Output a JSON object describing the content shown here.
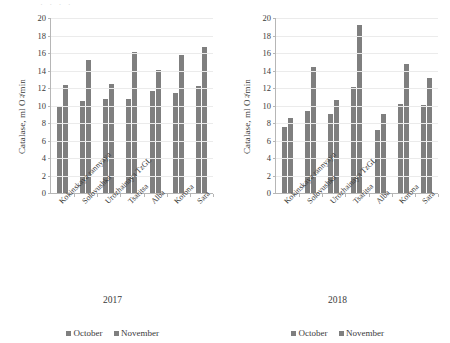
{
  "figure": {
    "top_cropped_text": "· ·  ·  ·",
    "bar_color": "#7f7f7f",
    "grid_color": "#ebebeb",
    "axis_color": "#b6b6b6",
    "text_color": "#3a3a3a"
  },
  "panels": [
    {
      "id": "panel-2017",
      "caption": "2017",
      "ylabel_prefix": "Catalase, ml O",
      "ylabel_sub": "2",
      "ylabel_suffix": "/min",
      "legend": [
        {
          "label": "October"
        },
        {
          "label": "November"
        }
      ]
    },
    {
      "id": "panel-2018",
      "caption": "2018",
      "ylabel_prefix": "Catalase, ml O",
      "ylabel_sub": "2",
      "ylabel_suffix": "/min",
      "legend": [
        {
          "label": "October"
        },
        {
          "label": "November"
        }
      ]
    }
  ],
  "chart_data": [
    {
      "type": "bar",
      "title": "2017",
      "xlabel": "",
      "ylabel": "Catalase, ml O2/min",
      "ylim": [
        0,
        20
      ],
      "yticks": [
        0,
        2,
        4,
        6,
        8,
        10,
        12,
        14,
        16,
        18,
        20
      ],
      "ytick_labels": [
        "0",
        "2",
        "4",
        "6",
        "8",
        "10",
        "12",
        "14",
        "16",
        "18",
        "20"
      ],
      "grid": true,
      "legend_position": "bottom",
      "categories": [
        "Kokinskaya rannyaya",
        "Solovushka",
        "Urozhainaya TzGL",
        "Tsaritsa",
        "Alba",
        "Korona",
        "Sara"
      ],
      "series": [
        {
          "name": "October",
          "color": "#7f7f7f",
          "values": [
            9.8,
            10.5,
            10.8,
            10.7,
            11.7,
            11.4,
            12.2
          ]
        },
        {
          "name": "November",
          "color": "#7f7f7f",
          "values": [
            12.3,
            15.2,
            12.5,
            16.1,
            14.1,
            15.8,
            16.7
          ]
        }
      ]
    },
    {
      "type": "bar",
      "title": "2018",
      "xlabel": "",
      "ylabel": "Catalase, ml O2/min",
      "ylim": [
        0,
        20
      ],
      "yticks": [
        0,
        2,
        4,
        6,
        8,
        10,
        12,
        14,
        16,
        18,
        20
      ],
      "ytick_labels": [
        "0",
        "2",
        "4",
        "6",
        "8",
        "10",
        "12",
        "14",
        "16",
        "18",
        "20"
      ],
      "grid": true,
      "legend_position": "bottom",
      "categories": [
        "Kokinskaya rannyaya",
        "Solovushka",
        "Urozhainaya TzGL",
        "Tsaritsa",
        "Alba",
        "Korona",
        "Sara"
      ],
      "series": [
        {
          "name": "October",
          "color": "#7f7f7f",
          "values": [
            7.5,
            9.4,
            9.0,
            12.1,
            7.2,
            10.2,
            10.1
          ]
        },
        {
          "name": "November",
          "color": "#7f7f7f",
          "values": [
            8.6,
            14.4,
            10.6,
            19.2,
            9.0,
            14.8,
            13.2
          ]
        }
      ]
    }
  ]
}
